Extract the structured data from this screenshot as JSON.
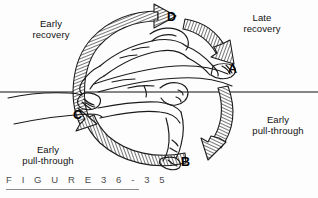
{
  "figure": {
    "caption": "F I G U R E   3 6 - 3 5",
    "caption_plain": "FIGURE 36-35",
    "number": "36-35",
    "background_color": "#fdfdfd",
    "ink_color": "#1a1a1a",
    "hatch_color": "#555555"
  },
  "water_line": {
    "name": "water-surface-line",
    "color": "#111111"
  },
  "phase_labels": [
    {
      "id": "A",
      "text": "A"
    },
    {
      "id": "B",
      "text": "B"
    },
    {
      "id": "C",
      "text": "C"
    },
    {
      "id": "D",
      "text": "D"
    }
  ],
  "annotations": [
    {
      "id": "early-recovery",
      "line1": "Early",
      "line2": "recovery",
      "position": "top-left"
    },
    {
      "id": "late-recovery",
      "line1": "Late",
      "line2": "recovery",
      "position": "top-right"
    },
    {
      "id": "early-pull-through-right",
      "line1": "Early",
      "line2": "pull-through",
      "position": "right"
    },
    {
      "id": "early-pull-through-left",
      "line1": "Early",
      "line2": "pull-through",
      "position": "bottom-left"
    }
  ],
  "arrows": [
    {
      "id": "arrow-early-recovery",
      "name": "early-recovery-arrow",
      "from": "C",
      "to": "D",
      "direction": "clockwise",
      "style": "hatched-curved"
    },
    {
      "id": "arrow-late-recovery",
      "name": "late-recovery-arrow",
      "from": "D",
      "to": "A",
      "direction": "clockwise",
      "style": "hatched-curved"
    },
    {
      "id": "arrow-early-pull-through-right",
      "name": "early-pull-through-right-arrow",
      "from": "A",
      "to": "B",
      "direction": "clockwise",
      "style": "hatched-curved"
    },
    {
      "id": "arrow-early-pull-through-left",
      "name": "early-pull-through-left-arrow",
      "from": "B",
      "to": "C",
      "direction": "clockwise",
      "style": "hatched-curved"
    }
  ]
}
